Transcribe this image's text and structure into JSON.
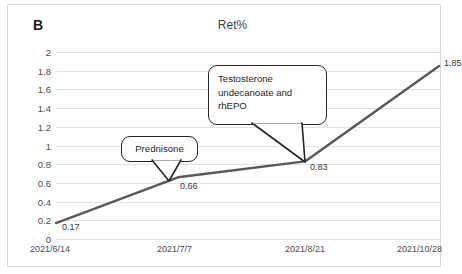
{
  "panel": {
    "label": "B"
  },
  "chart_data": {
    "type": "line",
    "title": "Ret%",
    "xlabel": "",
    "ylabel": "",
    "x": [
      "2021/6/14",
      "2021/7/7",
      "2021/8/21",
      "2021/10/28"
    ],
    "categories": [
      "2021/6/14",
      "2021/7/7",
      "2021/8/21",
      "2021/10/28"
    ],
    "values": [
      0.17,
      0.66,
      0.83,
      1.85
    ],
    "data_labels": [
      "0.17",
      "0.66",
      "0.83",
      "1.85"
    ],
    "series": [
      {
        "name": "Ret%",
        "values": [
          0.17,
          0.66,
          0.83,
          1.85
        ]
      }
    ],
    "ylim": [
      0,
      2
    ],
    "yticks": [
      "0",
      "0.2",
      "0.4",
      "0.6",
      "0.8",
      "1",
      "1.2",
      "1.4",
      "1.6",
      "1.8",
      "2"
    ],
    "ytick_values": [
      0,
      0.2,
      0.4,
      0.6,
      0.8,
      1,
      1.2,
      1.4,
      1.6,
      1.8,
      2
    ],
    "grid": "horizontal",
    "legend": "none",
    "line_color": "#595959",
    "grid_color": "#e2e2e2",
    "annotations": [
      {
        "text": "Prednisone",
        "points_to": "2021/7/7",
        "value": 0.66
      },
      {
        "text": "Testosterone\nundecanoate and\nrhEPO",
        "points_to": "2021/8/21",
        "value": 0.83
      }
    ]
  },
  "callouts": {
    "prednisone": "Prednisone",
    "testosterone": "Testosterone\nundecanoate and\nrhEPO"
  }
}
